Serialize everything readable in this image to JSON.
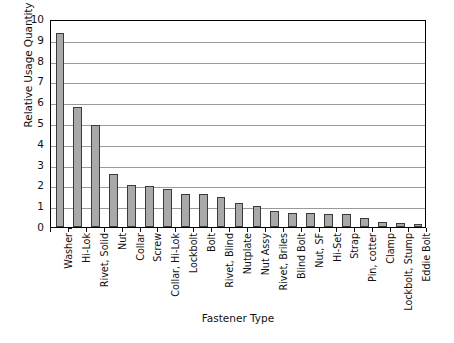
{
  "chart_data": {
    "type": "bar",
    "title": "",
    "xlabel": "Fastener Type",
    "ylabel": "Relative Usage Quantity",
    "ylim": [
      0,
      10
    ],
    "ytick_step": 1,
    "yticks": [
      10,
      9,
      8,
      7,
      6,
      5,
      4,
      3,
      2,
      1,
      0
    ],
    "grid": true,
    "legend": "none",
    "bar_color": "#a9a9a9",
    "bar_border_color": "#3a3a3a",
    "axis_color": "#000000",
    "gridline_color": "#9a9a9a",
    "categories": [
      "Washer",
      "Hi-Lok",
      "Rivet, Solid",
      "Nut",
      "Collar",
      "Screw",
      "Collar, Hi-Lok",
      "Lockbolt",
      "Bolt",
      "Rivet, Blind",
      "Nutplate",
      "Nut Assy",
      "Rivet, Briles",
      "Blind Bolt",
      "Nut, SF",
      "Hi-Set",
      "Strap",
      "Pin, cotter",
      "Clamp",
      "Lockbolt, Stump",
      "Eddie Bolt"
    ],
    "values": [
      9.35,
      5.75,
      4.9,
      2.55,
      2.0,
      1.98,
      1.85,
      1.58,
      1.57,
      1.42,
      1.17,
      1.03,
      0.78,
      0.66,
      0.65,
      0.64,
      0.61,
      0.43,
      0.23,
      0.2,
      0.15
    ]
  }
}
